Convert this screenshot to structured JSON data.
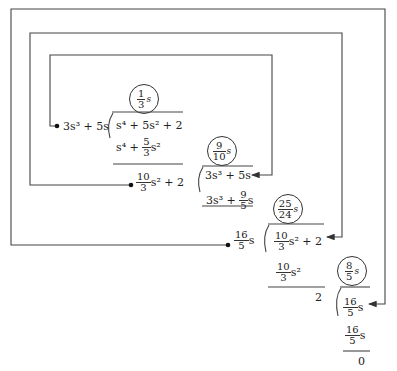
{
  "diagram": {
    "steps": [
      {
        "quotient": {
          "num": "1",
          "den": "3",
          "var": "s"
        },
        "divisor": "3s³ + 5s",
        "dividend": "s⁴ + 5s² + 2",
        "product": {
          "lead": "s⁴ + ",
          "num": "5",
          "den": "3",
          "tail": "s²"
        },
        "remainder": {
          "num": "10",
          "den": "3",
          "tail": "s² + 2"
        }
      },
      {
        "quotient": {
          "num": "9",
          "den": "10",
          "var": "s"
        },
        "dividend": "3s³ + 5s",
        "product": {
          "lead": "3s³ + ",
          "num": "9",
          "den": "5",
          "tail": "s"
        },
        "remainder": {
          "num": "16",
          "den": "5",
          "tail": "s"
        }
      },
      {
        "quotient": {
          "num": "25",
          "den": "24",
          "var": "s"
        },
        "dividend": {
          "num": "10",
          "den": "3",
          "tail": "s² + 2"
        },
        "product": {
          "num": "10",
          "den": "3",
          "tail": "s²"
        },
        "remainder": "2"
      },
      {
        "quotient": {
          "num": "8",
          "den": "5",
          "var": "s"
        },
        "dividend": {
          "num": "16",
          "den": "5",
          "tail": "s"
        },
        "product": {
          "num": "16",
          "den": "5",
          "tail": "s"
        },
        "remainder": "0"
      }
    ],
    "line_color": "#333333"
  }
}
